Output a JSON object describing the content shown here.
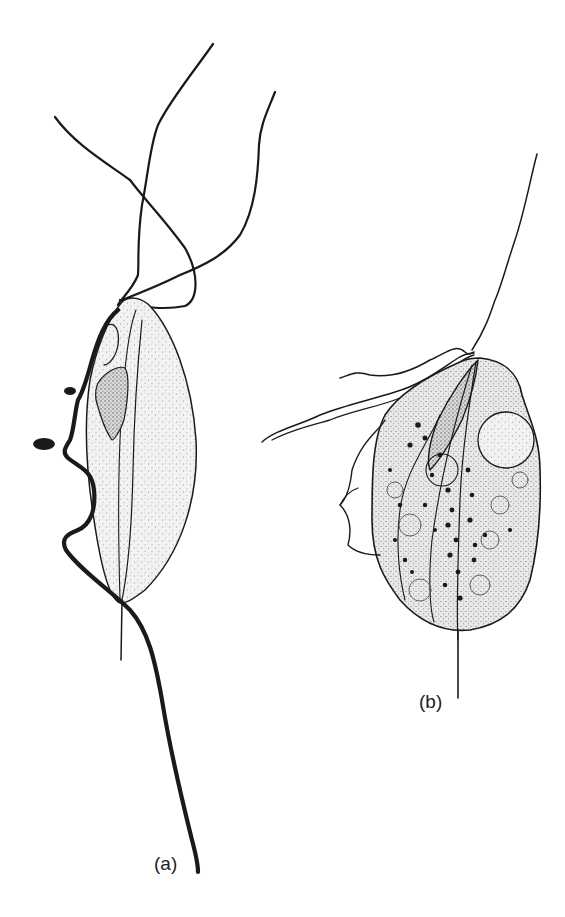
{
  "figure": {
    "panels": [
      {
        "id": "a",
        "label": "(a)"
      },
      {
        "id": "b",
        "label": "(b)"
      }
    ]
  },
  "colors": {
    "ink": "#1a1a1a",
    "stipple": "#9a9a9a",
    "cell_fill": "#eeeeee",
    "background": "#ffffff"
  }
}
